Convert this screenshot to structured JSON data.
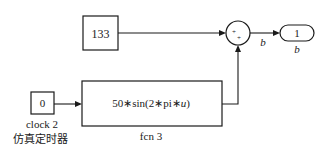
{
  "diagram": {
    "blocks": {
      "constant": {
        "value": "133"
      },
      "sum": {
        "signs": [
          "+",
          "+"
        ]
      },
      "outport": {
        "number": "1",
        "label": "b"
      },
      "clock": {
        "value": "0",
        "name": "clock 2",
        "caption": "仿真定时器"
      },
      "fcn": {
        "expression_prefix": "50∗sin(2∗pi∗",
        "expression_var": "u",
        "expression_suffix": ")",
        "name": "fcn 3"
      }
    },
    "signals": {
      "sum_output_label": "b"
    }
  }
}
